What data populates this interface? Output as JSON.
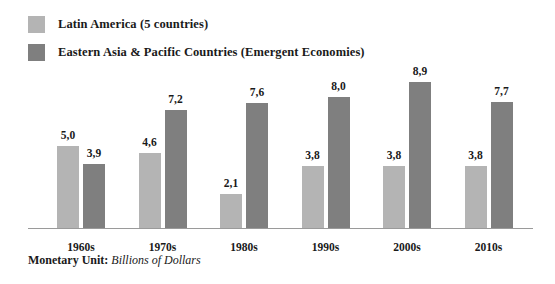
{
  "chart_data": {
    "type": "bar",
    "title": "",
    "xlabel": "",
    "ylabel": "",
    "ylim": [
      0,
      9.4
    ],
    "grid": false,
    "legend_position": "top-left",
    "decimal_separator": ",",
    "categories": [
      "1960s",
      "1970s",
      "1980s",
      "1990s",
      "2000s",
      "2010s"
    ],
    "series": [
      {
        "name": "Latin America (5 countries)",
        "color": "#b4b4b4",
        "values": [
          5.0,
          4.6,
          2.1,
          3.8,
          3.8,
          3.8
        ],
        "labels": [
          "5,0",
          "4,6",
          "2,1",
          "3,8",
          "3,8",
          "3,8"
        ]
      },
      {
        "name": "Eastern Asia & Pacific Countries (Emergent Economies)",
        "color": "#7f7f7f",
        "values": [
          3.9,
          7.2,
          7.6,
          8.0,
          8.9,
          7.7
        ],
        "labels": [
          "3,9",
          "7,2",
          "7,6",
          "8,0",
          "8,9",
          "7,7"
        ]
      }
    ],
    "annotations": {
      "unit_label": "Monetary Unit:",
      "unit_value": "Billions of Dollars"
    }
  },
  "legend": [
    {
      "label": "Latin America (5 countries)",
      "color": "#b4b4b4"
    },
    {
      "label": "Eastern Asia & Pacific Countries (Emergent Economies)",
      "color": "#7f7f7f"
    }
  ],
  "colors": {
    "series_light": "#b4b4b4",
    "series_dark": "#7f7f7f",
    "axis": "#9a9a9a",
    "text": "#1a1a1a",
    "background": "#ffffff"
  }
}
